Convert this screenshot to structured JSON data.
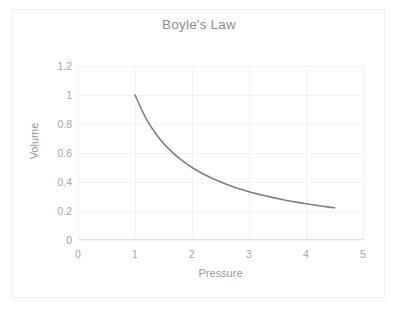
{
  "chart_data": {
    "type": "line",
    "title": "Boyle's Law",
    "xlabel": "Pressure",
    "ylabel": "Volume",
    "xlim": [
      0,
      5
    ],
    "ylim": [
      0,
      1.2
    ],
    "xticks": [
      "0",
      "1",
      "2",
      "3",
      "4",
      "5"
    ],
    "xtick_values": [
      0,
      1,
      2,
      3,
      4,
      5
    ],
    "yticks": [
      "0",
      "0.2",
      "0.4",
      "0.6",
      "0.8",
      "1",
      "1.2"
    ],
    "ytick_values": [
      0,
      0.2,
      0.4,
      0.6,
      0.8,
      1,
      1.2
    ],
    "grid": true,
    "legend": false,
    "series": [
      {
        "name": "Volume vs Pressure",
        "color": "#808080",
        "x": [
          1.0,
          1.2,
          1.4,
          1.6,
          1.8,
          2.0,
          2.2,
          2.4,
          2.6,
          2.8,
          3.0,
          3.2,
          3.4,
          3.6,
          3.8,
          4.0,
          4.2,
          4.4,
          4.5
        ],
        "values": [
          1.0,
          0.833,
          0.714,
          0.625,
          0.556,
          0.5,
          0.455,
          0.417,
          0.385,
          0.357,
          0.333,
          0.313,
          0.294,
          0.278,
          0.263,
          0.25,
          0.238,
          0.227,
          0.222
        ]
      }
    ]
  },
  "axis_title_color": "#9a9a9a",
  "tick_label_color": "#a6a6a6",
  "grid_color": "#f2f2f2"
}
